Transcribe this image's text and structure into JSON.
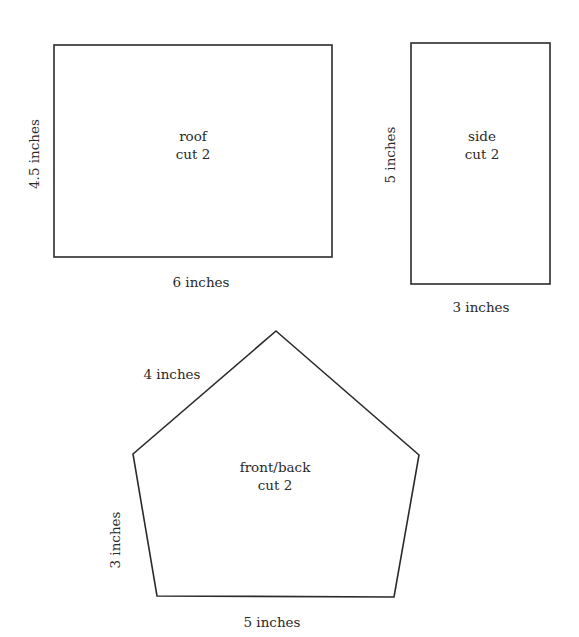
{
  "diagram": {
    "pieces": [
      {
        "id": "roof",
        "name": "roof",
        "instruction": "cut 2",
        "shape": "rectangle",
        "width_label": "6 inches",
        "height_label": "4.5 inches"
      },
      {
        "id": "side",
        "name": "side",
        "instruction": "cut 2",
        "shape": "rectangle",
        "width_label": "3 inches",
        "height_label": "5 inches"
      },
      {
        "id": "front_back",
        "name": "front/back",
        "instruction": "cut 2",
        "shape": "pentagon",
        "roof_edge_label": "4 inches",
        "wall_edge_label": "3 inches",
        "base_edge_label": "5 inches"
      }
    ],
    "colors": {
      "stroke": "#2b2b2b",
      "text": "#2a2a2a",
      "background": "#ffffff"
    }
  }
}
